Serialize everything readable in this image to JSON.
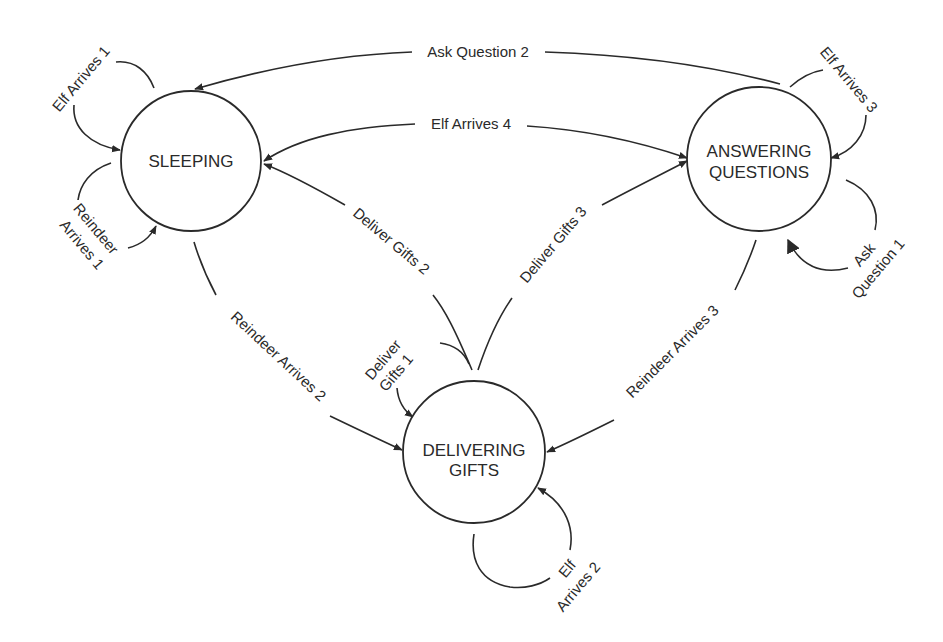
{
  "diagram": {
    "type": "state-transition-diagram",
    "colors": {
      "stroke": "#2a2a2a",
      "background": "#ffffff"
    },
    "states": [
      {
        "id": "sleeping",
        "label_lines": [
          "SLEEPING"
        ]
      },
      {
        "id": "answering",
        "label_lines": [
          "ANSWERING",
          "QUESTIONS"
        ]
      },
      {
        "id": "delivering",
        "label_lines": [
          "DELIVERING",
          "GIFTS"
        ]
      }
    ],
    "transitions": [
      {
        "id": "elf-arrives-1",
        "label_lines": [
          "Elf Arrives 1"
        ],
        "from": "sleeping",
        "to": "sleeping"
      },
      {
        "id": "reindeer-arrives-1",
        "label_lines": [
          "Reindeer",
          "Arrives 1"
        ],
        "from": "sleeping",
        "to": "sleeping"
      },
      {
        "id": "ask-question-2",
        "label_lines": [
          "Ask Question 2"
        ],
        "from": "answering",
        "to": "sleeping"
      },
      {
        "id": "elf-arrives-4",
        "label_lines": [
          "Elf Arrives 4"
        ],
        "from": "sleeping",
        "to": "answering"
      },
      {
        "id": "elf-arrives-3",
        "label_lines": [
          "Elf Arrives 3"
        ],
        "from": "answering",
        "to": "answering"
      },
      {
        "id": "ask-question-1",
        "label_lines": [
          "Ask",
          "Question 1"
        ],
        "from": "answering",
        "to": "answering"
      },
      {
        "id": "deliver-gifts-2",
        "label_lines": [
          "Deliver Gifts 2"
        ],
        "from": "delivering",
        "to": "sleeping"
      },
      {
        "id": "deliver-gifts-3",
        "label_lines": [
          "Deliver Gifts 3"
        ],
        "from": "delivering",
        "to": "answering"
      },
      {
        "id": "deliver-gifts-1",
        "label_lines": [
          "Deliver",
          "Gifts 1"
        ],
        "from": "delivering",
        "to": "delivering"
      },
      {
        "id": "reindeer-arrives-2",
        "label_lines": [
          "Reindeer Arrives 2"
        ],
        "from": "sleeping",
        "to": "delivering"
      },
      {
        "id": "reindeer-arrives-3",
        "label_lines": [
          "Reindeer Arrives 3"
        ],
        "from": "answering",
        "to": "delivering"
      },
      {
        "id": "elf-arrives-2",
        "label_lines": [
          "Elf",
          "Arrives 2"
        ],
        "from": "delivering",
        "to": "delivering"
      }
    ]
  }
}
